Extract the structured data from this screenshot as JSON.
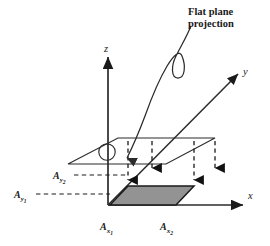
{
  "figure": {
    "callout": {
      "line1": "Flat plane",
      "line2": "projection"
    },
    "axes": {
      "z_label": "z",
      "y_label": "y",
      "x_label": "x"
    },
    "area_labels": {
      "a_y2_base": "A",
      "a_y2_sub": "y",
      "a_y2_subsub": "2",
      "a_y1_base": "A",
      "a_y1_sub": "y",
      "a_y1_subsub": "1",
      "a_x1_base": "A",
      "a_x1_sub": "x",
      "a_x1_subsub": "1",
      "a_x2_base": "A",
      "a_x2_sub": "x",
      "a_x2_subsub": "2"
    },
    "colors": {
      "stroke": "#2b2b2b",
      "shaded_fill": "#8a8a8a",
      "shaded_edge": "#1a1a1a",
      "background": "#ffffff",
      "plane_fill": "#ffffff"
    }
  }
}
